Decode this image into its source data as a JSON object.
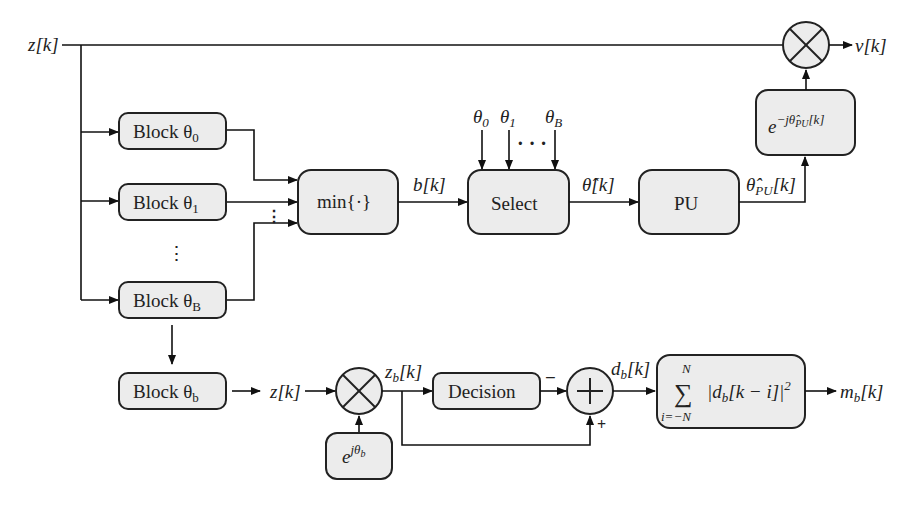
{
  "signals": {
    "input": "z[k]",
    "output": "ν[k]",
    "min_out": "b[k]",
    "select_out": "θ̂[k]",
    "pu_out": "θ̂",
    "pu_out_sub": "PU",
    "pu_out_tail": "[k]",
    "theta0": "θ",
    "theta0_sub": "0",
    "theta1": "θ",
    "theta1_sub": "1",
    "thetaB": "θ",
    "thetaB_sub": "B",
    "detail_in": "z[k]",
    "zb": "z",
    "zb_sub": "b",
    "zb_tail": "[k]",
    "db": "d",
    "db_sub": "b",
    "db_tail": "[k]",
    "mb": "m",
    "mb_sub": "b",
    "mb_tail": "[k]",
    "minus": "−",
    "plus": "+"
  },
  "blocks": {
    "block0": {
      "label": "Block θ",
      "sub": "0"
    },
    "block1": {
      "label": "Block θ",
      "sub": "1"
    },
    "blockB": {
      "label": "Block θ",
      "sub": "B"
    },
    "blockb": {
      "label": "Block θ",
      "sub": "b"
    },
    "min": {
      "label": "min{·}"
    },
    "select": {
      "label": "Select"
    },
    "pu": {
      "label": "PU"
    },
    "derot": {
      "base": "e",
      "exp": "−jθ̂",
      "exp_sub": "PU",
      "exp_tail": "[k]"
    },
    "rot": {
      "base": "e",
      "exp": "jθ",
      "exp_sub": "b"
    },
    "decision": {
      "label": "Decision"
    },
    "sum": {
      "sigma": "∑",
      "upper": "N",
      "lower": "i=−N",
      "expr": "|d",
      "expr_sub": "b",
      "expr_tail": "[k − i]|",
      "power": "2"
    }
  },
  "ellipsis": {
    "vertical": "⋮",
    "horizontal": "· · ·"
  }
}
